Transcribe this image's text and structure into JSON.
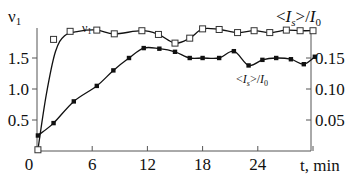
{
  "chart_data": {
    "type": "line",
    "title": "",
    "xlabel": "t, min",
    "ylabel_left": "v1",
    "ylabel_right": "<Is>/I0",
    "xlim": [
      0,
      31
    ],
    "ylim_left": [
      0,
      2.0
    ],
    "ylim_right": [
      0,
      0.2
    ],
    "grid": false,
    "legend_position": "inline labels near curves",
    "x_ticks": [
      0,
      6,
      12,
      18,
      24,
      30
    ],
    "x_tick_labels": [
      "0",
      "6",
      "12",
      "18",
      "24",
      ""
    ],
    "y_left_ticks": [
      0.5,
      1.0,
      1.5
    ],
    "y_left_tick_labels": [
      "0.5",
      "1.0",
      "1.5"
    ],
    "y_right_ticks": [
      0.05,
      0.1,
      0.15
    ],
    "y_right_tick_labels": [
      "0.05",
      "0.10",
      "0.15"
    ],
    "series": [
      {
        "name": "v1",
        "label": "v1",
        "axis": "left",
        "marker": "open-square",
        "x": [
          0.1,
          1.8,
          3.6,
          6.5,
          8.4,
          11.4,
          13.2,
          15.0,
          16.6,
          18.0,
          19.8,
          21.8,
          23.6,
          25.3,
          27.1,
          28.6,
          30.0
        ],
        "values": [
          0.02,
          1.8,
          1.93,
          1.95,
          1.89,
          1.94,
          1.88,
          1.74,
          1.82,
          1.97,
          1.96,
          1.91,
          1.94,
          1.91,
          1.95,
          1.94,
          1.94
        ]
      },
      {
        "name": "<Is>/I0",
        "label": "<Is>/I0",
        "axis": "right",
        "marker": "filled-square",
        "x": [
          0.1,
          1.8,
          4.0,
          6.5,
          8.3,
          10.0,
          11.6,
          13.3,
          15.0,
          16.6,
          18.0,
          19.8,
          21.4,
          23.0,
          24.5,
          26.0,
          27.6,
          29.0,
          30.2
        ],
        "values": [
          0.025,
          0.045,
          0.08,
          0.105,
          0.13,
          0.15,
          0.166,
          0.165,
          0.16,
          0.15,
          0.15,
          0.15,
          0.161,
          0.138,
          0.147,
          0.15,
          0.148,
          0.14,
          0.152
        ]
      }
    ]
  }
}
